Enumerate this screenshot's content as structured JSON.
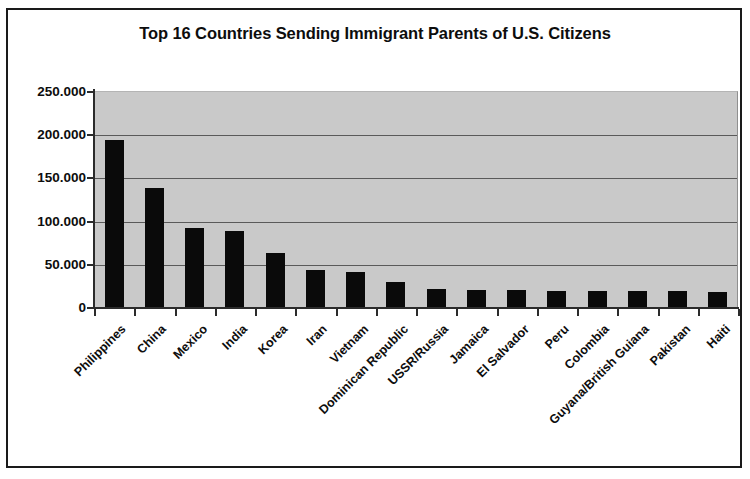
{
  "chart_data": {
    "type": "bar",
    "title": "Top 16 Countries Sending Immigrant Parents of U.S. Citizens",
    "xlabel": "",
    "ylabel": "",
    "ylim": [
      0,
      250000
    ],
    "grid": true,
    "legend": "none",
    "orientation": "vertical",
    "bar_color": "#0a0a0a",
    "plot_background": "#c9c9c9",
    "tick_label_format": "dot-thousands-separator",
    "y_ticks": [
      0,
      50000,
      100000,
      150000,
      200000,
      250000
    ],
    "y_tick_labels": [
      "0",
      "50.000",
      "100.000",
      "150.000",
      "200.000",
      "250.000"
    ],
    "categories": [
      "Philippines",
      "China",
      "Mexico",
      "India",
      "Korea",
      "Iran",
      "Vietnam",
      "Dominican Republic",
      "USSR/Russia",
      "Jamaica",
      "El Salvador",
      "Peru",
      "Colombia",
      "Guyana/British Guiana",
      "Pakistan",
      "Haiti"
    ],
    "values": [
      193000,
      138000,
      92000,
      88000,
      63000,
      43000,
      40000,
      29000,
      21000,
      20000,
      20000,
      19000,
      19000,
      18000,
      18000,
      17000
    ]
  }
}
